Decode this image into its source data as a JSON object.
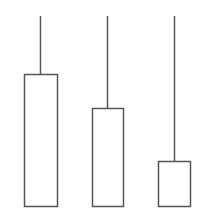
{
  "diagram": {
    "background": "#ffffff",
    "stroke_color": "#555555",
    "fill_color": "#ffffff",
    "stroke_width": 1.5,
    "shapes": [
      {
        "name": "candle-1",
        "wick_x": 40.5,
        "wick_top": 16,
        "box_x": 24.5,
        "box_y": 74.5,
        "box_w": 33,
        "box_h": 132
      },
      {
        "name": "candle-2",
        "wick_x": 107.5,
        "wick_top": 16,
        "box_x": 92.5,
        "box_y": 108.5,
        "box_w": 31,
        "box_h": 98
      },
      {
        "name": "candle-3",
        "wick_x": 174.5,
        "wick_top": 16,
        "box_x": 158.5,
        "box_y": 161.5,
        "box_w": 32,
        "box_h": 45
      }
    ]
  }
}
